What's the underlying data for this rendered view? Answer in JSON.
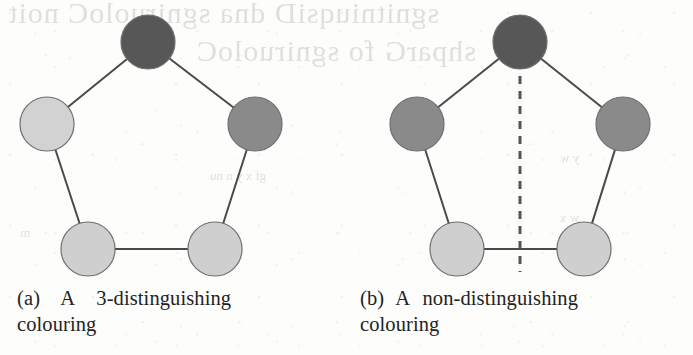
{
  "figure": {
    "kind": "graph-theory-figure",
    "panels": [
      {
        "id": "a",
        "caption_label": "(a)",
        "caption_word_1": "A",
        "caption_word_2": "3-distinguishing",
        "caption_line_2": "colouring",
        "graph": {
          "shape": "pentagon",
          "node_count": 5,
          "edge_count": 5,
          "has_dashed_axis": false,
          "nodes": [
            {
              "name": "top",
              "cx": 148,
              "cy": 42,
              "r": 27,
              "fill": "#575757",
              "colour_class": "dark"
            },
            {
              "name": "upper-left",
              "cx": 47,
              "cy": 124,
              "r": 27,
              "fill": "#d2d2d2",
              "colour_class": "light"
            },
            {
              "name": "upper-right",
              "cx": 255,
              "cy": 124,
              "r": 27,
              "fill": "#8a8a8a",
              "colour_class": "medium"
            },
            {
              "name": "lower-left",
              "cx": 88,
              "cy": 249,
              "r": 27,
              "fill": "#cfcfcf",
              "colour_class": "light"
            },
            {
              "name": "lower-right",
              "cx": 215,
              "cy": 249,
              "r": 27,
              "fill": "#cfcfcf",
              "colour_class": "light"
            }
          ],
          "edges": [
            {
              "from": "top",
              "to": "upper-left"
            },
            {
              "from": "top",
              "to": "upper-right"
            },
            {
              "from": "upper-left",
              "to": "lower-left"
            },
            {
              "from": "upper-right",
              "to": "lower-right"
            },
            {
              "from": "lower-left",
              "to": "lower-right"
            }
          ]
        }
      },
      {
        "id": "b",
        "caption_label": "(b)",
        "caption_word_1": "A",
        "caption_word_2": "non-distinguishing",
        "caption_line_2": "colouring",
        "graph": {
          "shape": "pentagon",
          "node_count": 5,
          "edge_count": 5,
          "has_dashed_axis": true,
          "axis": {
            "name": "symmetry-axis",
            "x": 520,
            "y1": 46,
            "y2": 272
          },
          "nodes": [
            {
              "name": "top",
              "cx": 520,
              "cy": 42,
              "r": 27,
              "fill": "#575757",
              "colour_class": "dark"
            },
            {
              "name": "upper-left",
              "cx": 417,
              "cy": 124,
              "r": 27,
              "fill": "#8a8a8a",
              "colour_class": "medium"
            },
            {
              "name": "upper-right",
              "cx": 623,
              "cy": 124,
              "r": 27,
              "fill": "#8a8a8a",
              "colour_class": "medium"
            },
            {
              "name": "lower-left",
              "cx": 457,
              "cy": 249,
              "r": 27,
              "fill": "#cfcfcf",
              "colour_class": "light"
            },
            {
              "name": "lower-right",
              "cx": 584,
              "cy": 249,
              "r": 27,
              "fill": "#cfcfcf",
              "colour_class": "light"
            }
          ],
          "edges": [
            {
              "from": "top",
              "to": "upper-left"
            },
            {
              "from": "top",
              "to": "upper-right"
            },
            {
              "from": "upper-left",
              "to": "lower-left"
            },
            {
              "from": "upper-right",
              "to": "lower-right"
            },
            {
              "from": "lower-left",
              "to": "lower-right"
            }
          ]
        }
      }
    ]
  },
  "background_showthrough": {
    "description": "faint mirrored ink bleeding through from the reverse side of the scanned page",
    "title_line_1": "sgnitniuqsiD dna sgniruoloC noit",
    "title_line_2": "shparG fo sgniruoloC",
    "small_1": "w y p",
    "small_2": "gf x y n nu",
    "small_3": "y w",
    "small_4": "w x",
    "small_5": "m"
  },
  "colors": {
    "node_dark": "#575757",
    "node_medium": "#8a8a8a",
    "node_light": "#cfcfcf",
    "node_stroke": "#6f6f6f",
    "edge": "#4a4a4a",
    "dashed_axis": "#555555",
    "caption_text": "#232323",
    "page_background": "#fdfdfc",
    "showthrough_text": "#c9c7c6"
  }
}
